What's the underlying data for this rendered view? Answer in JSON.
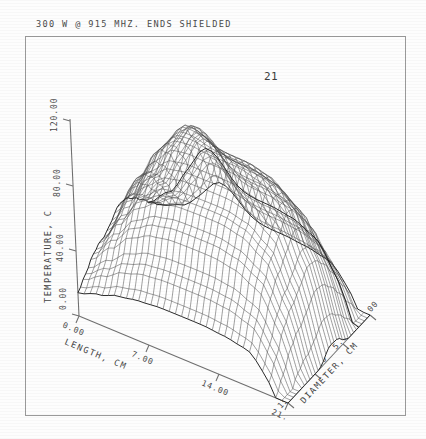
{
  "figure": {
    "title": "300 W @ 915 MHZ. ENDS SHIELDED",
    "number": "21"
  },
  "chart_data": {
    "type": "surface",
    "title": "300 W @ 915 MHZ. ENDS SHIELDED",
    "figure_number": "21",
    "xlabel": "LENGTH, CM",
    "ylabel": "DIAMETER, CM",
    "zlabel": "TEMPERATURE, C",
    "grid": false,
    "legend": "none",
    "xlim": [
      0.0,
      21.0
    ],
    "ylim": [
      0.0,
      15.0
    ],
    "zlim": [
      0.0,
      120.0
    ],
    "xticks": [
      "0.00",
      "7.00",
      "14.00",
      "21.00"
    ],
    "yticks": [
      "15.00",
      "10.00",
      "5.00",
      "0.00"
    ],
    "zticks": [
      "0.00",
      "40.00",
      "80.00",
      "120.00"
    ],
    "x_values": [
      0.0,
      2.1,
      4.2,
      6.3,
      8.4,
      10.5,
      12.6,
      14.7,
      16.8,
      18.9,
      21.0
    ],
    "y_values": [
      0.0,
      1.5,
      3.0,
      4.5,
      6.0,
      7.5,
      9.0,
      10.5,
      12.0,
      13.5,
      15.0
    ],
    "z_matrix": [
      [
        14,
        20,
        27,
        33,
        38,
        40,
        38,
        33,
        27,
        20,
        14
      ],
      [
        18,
        28,
        40,
        50,
        57,
        60,
        57,
        50,
        40,
        28,
        18
      ],
      [
        22,
        36,
        52,
        65,
        74,
        78,
        74,
        65,
        52,
        36,
        22
      ],
      [
        24,
        40,
        58,
        72,
        82,
        86,
        82,
        72,
        58,
        40,
        24
      ],
      [
        25,
        41,
        60,
        74,
        84,
        88,
        84,
        74,
        60,
        41,
        25
      ],
      [
        25,
        41,
        60,
        74,
        84,
        88,
        84,
        74,
        60,
        41,
        25
      ],
      [
        25,
        41,
        60,
        74,
        84,
        88,
        84,
        74,
        60,
        41,
        25
      ],
      [
        24,
        40,
        58,
        72,
        82,
        86,
        82,
        72,
        58,
        40,
        24
      ],
      [
        22,
        36,
        52,
        65,
        74,
        78,
        74,
        65,
        52,
        36,
        22
      ],
      [
        18,
        28,
        40,
        50,
        57,
        60,
        57,
        50,
        40,
        28,
        18
      ],
      [
        14,
        20,
        27,
        33,
        38,
        40,
        38,
        33,
        27,
        20,
        14
      ]
    ],
    "mesh_density_u": 34,
    "mesh_density_v": 30,
    "colors": {
      "mesh": "#4c4c4c",
      "axis": "#6f6f6f",
      "frame": "#9a9a9a",
      "text": "#4a4a4a",
      "background": "#fdfdfd"
    }
  },
  "axes": {
    "z": {
      "name": "TEMPERATURE, C",
      "ticks": [
        "0.00",
        "40.00",
        "80.00",
        "120.00"
      ]
    },
    "x": {
      "name": "LENGTH, CM",
      "ticks": [
        "0.00",
        "7.00",
        "14.00",
        "21."
      ]
    },
    "y": {
      "name": "DIAMETER, CM",
      "ticks": [
        "15.00",
        "10.00",
        "5.00",
        "0.00"
      ]
    }
  }
}
